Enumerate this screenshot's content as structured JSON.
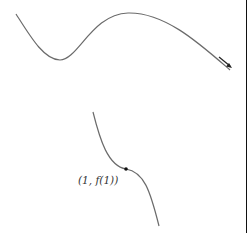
{
  "figure": {
    "upper_curve": {
      "description": "curve with local minimum then local maximum, decreasing at right end",
      "arrow_direction": "down-right"
    },
    "lower_curve": {
      "description": "decreasing curve with horizontal inflection point"
    },
    "point": {
      "label": "(1, f(1))"
    },
    "colors": {
      "curve": "#6b6b6b",
      "point": "#111111",
      "border": "#111111"
    }
  }
}
